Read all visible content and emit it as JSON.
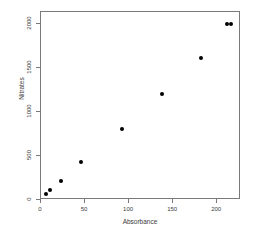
{
  "chart_data": {
    "type": "scatter",
    "title": "",
    "xlabel": "Absorbance",
    "ylabel": "Nitrates",
    "xlim": [
      0,
      227
    ],
    "ylim": [
      0,
      2140
    ],
    "xticks": [
      0,
      50,
      100,
      150,
      200
    ],
    "xticklabels": [
      "0",
      "50",
      "100",
      "150",
      "200"
    ],
    "yticks": [
      0,
      500,
      1000,
      1500,
      2000
    ],
    "yticklabels": [
      "0",
      "500",
      "1000",
      "1500",
      "2000"
    ],
    "grid": false,
    "legend": null,
    "marker": "filled-circle",
    "marker_color": "#000000",
    "points": [
      {
        "x": 7,
        "y": 60
      },
      {
        "x": 11,
        "y": 100
      },
      {
        "x": 24,
        "y": 200
      },
      {
        "x": 47,
        "y": 420
      },
      {
        "x": 93,
        "y": 800
      },
      {
        "x": 138,
        "y": 1200
      },
      {
        "x": 183,
        "y": 1600
      },
      {
        "x": 212,
        "y": 1990
      },
      {
        "x": 217,
        "y": 1990
      }
    ]
  }
}
